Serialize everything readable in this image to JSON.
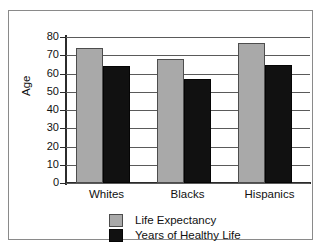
{
  "chart_data": {
    "type": "bar",
    "title": "",
    "xlabel": "",
    "ylabel": "Age",
    "categories": [
      "Whites",
      "Blacks",
      "Hispanics"
    ],
    "series": [
      {
        "name": "Life Expectancy",
        "color": "#a9a9a9",
        "values": [
          74,
          68,
          76.5
        ]
      },
      {
        "name": "Years of Healthy Life",
        "color": "#111111",
        "values": [
          64,
          57,
          64.5
        ]
      }
    ],
    "ylim": [
      0,
      80
    ],
    "ytick_labels": [
      "80",
      "70",
      "60",
      "50",
      "40",
      "30",
      "20",
      "10",
      "0"
    ],
    "ytick_values": [
      80,
      70,
      60,
      50,
      40,
      30,
      20,
      10,
      0
    ],
    "grid": true,
    "grid_axis": "y",
    "legend_position": "bottom-center"
  },
  "legend": {
    "entries": [
      {
        "label": "Life Expectancy",
        "swatch": "light"
      },
      {
        "label": "Years of Healthy Life",
        "swatch": "dark"
      }
    ]
  },
  "axis": {
    "y_title": "Age"
  }
}
